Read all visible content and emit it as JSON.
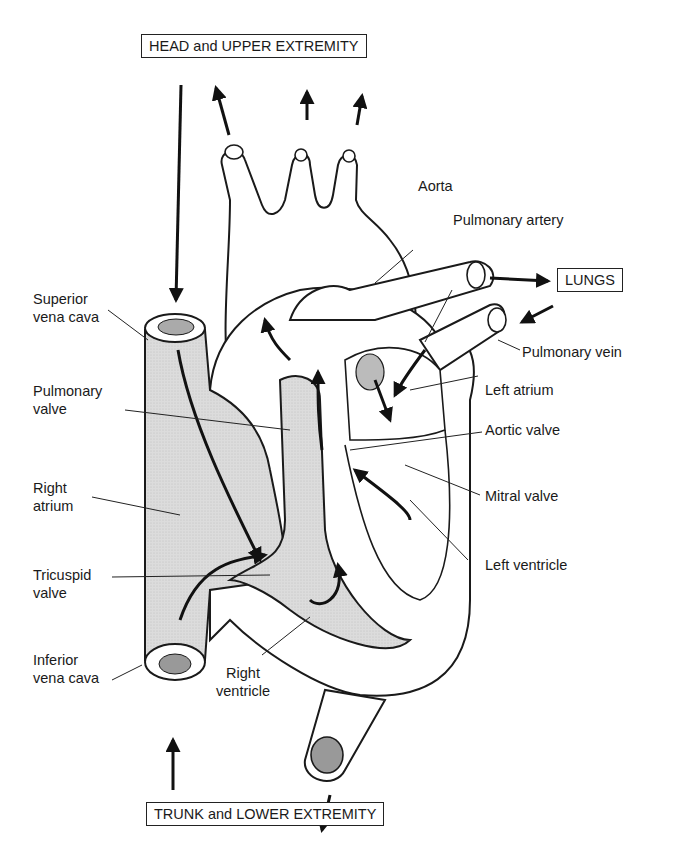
{
  "diagram": {
    "boxes": {
      "top": "HEAD and UPPER EXTREMITY",
      "lungs": "LUNGS",
      "bottom": "TRUNK and LOWER EXTREMITY"
    },
    "labels": {
      "aorta": "Aorta",
      "pulmonary_artery": "Pulmonary artery",
      "superior_vena_cava": "Superior\nvena cava",
      "pulmonary_vein": "Pulmonary vein",
      "pulmonary_valve": "Pulmonary\nvalve",
      "left_atrium": "Left atrium",
      "aortic_valve": "Aortic valve",
      "right_atrium": "Right\natrium",
      "mitral_valve": "Mitral valve",
      "left_ventricle": "Left ventricle",
      "tricuspid_valve": "Tricuspid\nvalve",
      "inferior_vena_cava": "Inferior\nvena cava",
      "right_ventricle": "Right\nventricle"
    },
    "colors": {
      "line": "#1a1a1a",
      "fill_deoxygenated": "#d9d9d9",
      "background": "#ffffff"
    }
  }
}
